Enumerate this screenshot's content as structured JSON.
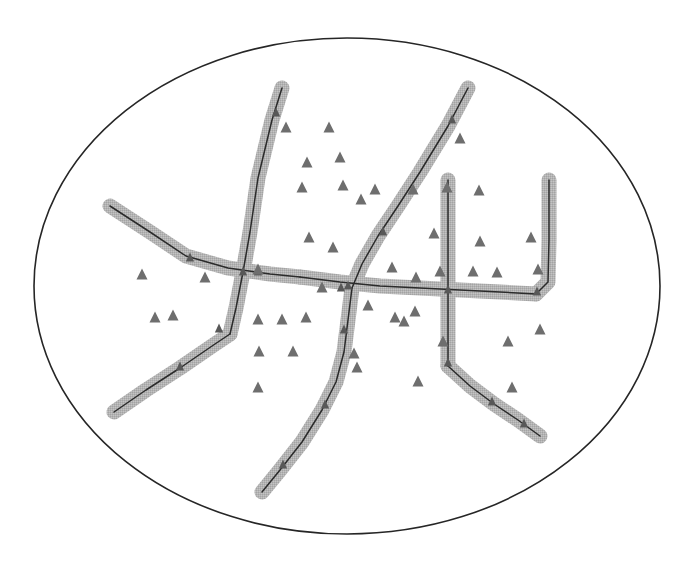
{
  "figure": {
    "background_color": "#ffffff",
    "width": 688,
    "height": 571
  },
  "boundary": {
    "shape": "ellipse",
    "label": "study-area-boundary",
    "cx": 347,
    "cy": 286,
    "rx": 313,
    "ry": 248,
    "stroke_color": "#262626",
    "stroke_width": 1.6,
    "fill": "none"
  },
  "styles": {
    "halo_color": "#b0b0b0",
    "halo_width": 15,
    "centerline_color": "#2b2b2b",
    "centerline_width": 1.5,
    "marker_color": "#6e6e6e",
    "marker_size": 11
  },
  "network": {
    "name": "branching-corridor-network",
    "branch_count": 9,
    "branches": [
      {
        "id": "branch-north-west-trunk",
        "label": "north west trunk",
        "points": "282,88 272,120 258,178 250,232 243,272 236,308 230,334"
      },
      {
        "id": "branch-south-west-spur",
        "label": "south west spur",
        "points": "230,334 215,344 180,368 146,390 114,412"
      },
      {
        "id": "branch-west-arm",
        "label": "west arm",
        "points": "110,206 150,232 186,256 228,268 270,274 300,277"
      },
      {
        "id": "branch-main-horizontal",
        "label": "main horizontal corridor",
        "points": "300,277 340,282 380,286 420,288 460,290 500,292 536,294"
      },
      {
        "id": "branch-north-east-trunk",
        "label": "north east trunk",
        "points": "468,88 448,126 420,172 398,206 378,236 362,264 352,288"
      },
      {
        "id": "branch-south-centre-trunk",
        "label": "south centre trunk",
        "points": "352,288 348,320 344,352 336,382 322,410 302,442 280,470 262,492"
      },
      {
        "id": "branch-centre-vertical",
        "label": "centre vertical corridor",
        "points": "448,180 448,230 448,290 448,330 448,366"
      },
      {
        "id": "branch-south-east-spur",
        "label": "south east spur",
        "points": "448,366 470,386 494,404 518,420 540,436"
      },
      {
        "id": "branch-east-hook",
        "label": "east hook",
        "points": "536,294 548,282 549,240 549,204 549,180"
      }
    ]
  },
  "markers": {
    "name": "triangle-markers",
    "shape": "triangle",
    "count": 46,
    "positions": [
      [
        286,
        128
      ],
      [
        329,
        128
      ],
      [
        340,
        158
      ],
      [
        302,
        188
      ],
      [
        343,
        186
      ],
      [
        375,
        190
      ],
      [
        309,
        238
      ],
      [
        333,
        248
      ],
      [
        258,
        270
      ],
      [
        413,
        190
      ],
      [
        479,
        191
      ],
      [
        434,
        234
      ],
      [
        416,
        278
      ],
      [
        322,
        288
      ],
      [
        392,
        268
      ],
      [
        404,
        322
      ],
      [
        142,
        275
      ],
      [
        205,
        278
      ],
      [
        155,
        318
      ],
      [
        173,
        316
      ],
      [
        258,
        320
      ],
      [
        282,
        320
      ],
      [
        306,
        318
      ],
      [
        395,
        318
      ],
      [
        415,
        312
      ],
      [
        440,
        272
      ],
      [
        473,
        272
      ],
      [
        538,
        270
      ],
      [
        259,
        352
      ],
      [
        293,
        352
      ],
      [
        357,
        368
      ],
      [
        443,
        342
      ],
      [
        508,
        342
      ],
      [
        418,
        382
      ],
      [
        512,
        388
      ],
      [
        540,
        330
      ],
      [
        531,
        238
      ],
      [
        480,
        242
      ],
      [
        258,
        388
      ],
      [
        354,
        354
      ],
      [
        497,
        273
      ],
      [
        361,
        200
      ],
      [
        460,
        139
      ],
      [
        307,
        163
      ],
      [
        368,
        306
      ],
      [
        447,
        188
      ]
    ]
  },
  "flow_arrows": {
    "name": "direction-arrowheads",
    "count": 18,
    "positions": [
      [
        276,
        113
      ],
      [
        243,
        272
      ],
      [
        219,
        329
      ],
      [
        180,
        367
      ],
      [
        190,
        258
      ],
      [
        258,
        272
      ],
      [
        348,
        286
      ],
      [
        341,
        288
      ],
      [
        344,
        330
      ],
      [
        325,
        405
      ],
      [
        283,
        465
      ],
      [
        383,
        232
      ],
      [
        452,
        120
      ],
      [
        448,
        290
      ],
      [
        448,
        363
      ],
      [
        492,
        402
      ],
      [
        524,
        424
      ],
      [
        537,
        292
      ]
    ]
  }
}
